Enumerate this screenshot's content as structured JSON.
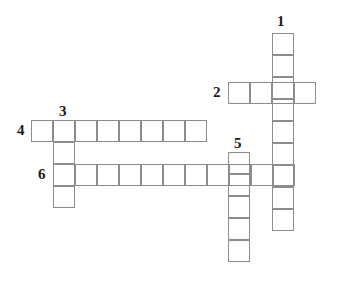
{
  "puzzle": {
    "title": "Crossword Grid",
    "background_color": "#ffffff",
    "cell_border_color": "#8c8c8c",
    "number_color": "#1a1a1a",
    "cell_size": 22,
    "canvas": {
      "width": 342,
      "height": 286
    },
    "numbers": [
      {
        "id": "1",
        "label": "1",
        "x": 277,
        "y": 14
      },
      {
        "id": "2",
        "label": "2",
        "x": 213,
        "y": 85
      },
      {
        "id": "3",
        "label": "3",
        "x": 59,
        "y": 104
      },
      {
        "id": "4",
        "label": "4",
        "x": 17,
        "y": 123
      },
      {
        "id": "5",
        "label": "5",
        "x": 234,
        "y": 136
      },
      {
        "id": "6",
        "label": "6",
        "x": 38,
        "y": 167
      }
    ],
    "entries": [
      {
        "id": "entry-1-down",
        "number": "1",
        "direction": "down",
        "length": 9,
        "start_x": 272,
        "start_y": 33
      },
      {
        "id": "entry-2-across",
        "number": "2",
        "direction": "across",
        "length": 4,
        "start_x": 228,
        "start_y": 82
      },
      {
        "id": "entry-3-down",
        "number": "3",
        "direction": "down",
        "length": 4,
        "start_x": 53,
        "start_y": 120
      },
      {
        "id": "entry-4-across",
        "number": "4",
        "direction": "across",
        "length": 8,
        "start_x": 31,
        "start_y": 120
      },
      {
        "id": "entry-5-down",
        "number": "5",
        "direction": "down",
        "length": 5,
        "start_x": 228,
        "start_y": 152
      },
      {
        "id": "entry-6-across",
        "number": "6",
        "direction": "across",
        "length": 11,
        "start_x": 53,
        "start_y": 164
      }
    ]
  }
}
